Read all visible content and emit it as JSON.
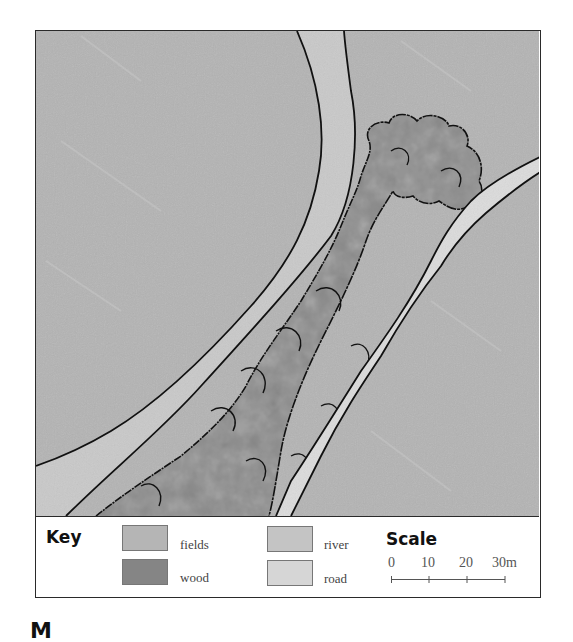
{
  "map": {
    "features": [
      {
        "name": "fields",
        "color": "#b4b4b4"
      },
      {
        "name": "river",
        "color": "#c9c9c9"
      },
      {
        "name": "road",
        "color": "#dcdcdc"
      },
      {
        "name": "wood",
        "color": "#8a8a8a"
      }
    ]
  },
  "legend": {
    "key_title": "Key",
    "items": [
      {
        "label": "fields",
        "color": "#b5b5b5"
      },
      {
        "label": "wood",
        "color": "#858585"
      },
      {
        "label": "river",
        "color": "#c4c4c4"
      },
      {
        "label": "road",
        "color": "#d6d6d6"
      }
    ],
    "scale_title": "Scale",
    "scale_ticks": [
      "0",
      "10",
      "20",
      "30m"
    ]
  },
  "caption": "M"
}
